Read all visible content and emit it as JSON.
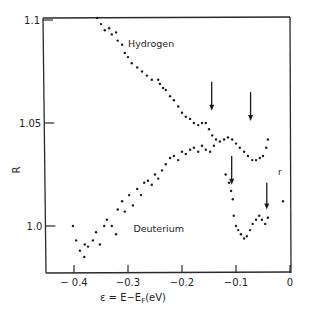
{
  "chart_data": {
    "type": "scatter",
    "title": "",
    "xlabel": "ε = E−E_F(eV)",
    "ylabel": "R",
    "xlim": [
      -0.43,
      0.0
    ],
    "ylim": [
      0.975,
      1.1
    ],
    "x_ticks": [
      -0.4,
      -0.3,
      -0.2,
      -0.1,
      0
    ],
    "x_tick_labels": [
      "− 0.4",
      "−0.3",
      "−0.2",
      "−0.1",
      "0"
    ],
    "y_ticks": [
      1.0,
      1.05,
      1.1
    ],
    "y_tick_labels": [
      "1.0",
      "1.05",
      "1.1"
    ],
    "grid": false,
    "legend": "inline labels",
    "annotations": [
      {
        "type": "arrow-down",
        "x": -0.145,
        "y_top": 1.07,
        "y_bottom": 1.056
      },
      {
        "type": "arrow-down",
        "x": -0.073,
        "y_top": 1.065,
        "y_bottom": 1.051
      },
      {
        "type": "arrow-down",
        "x": -0.108,
        "y_top": 1.034,
        "y_bottom": 1.02
      },
      {
        "type": "arrow-down",
        "x": -0.043,
        "y_top": 1.021,
        "y_bottom": 1.008
      },
      {
        "type": "text",
        "text": "r",
        "x": -0.022,
        "y": 1.025
      }
    ],
    "series": [
      {
        "name": "Hydrogen",
        "label_pos": [
          -0.3,
          1.087
        ],
        "points": [
          [
            -0.357,
            1.101
          ],
          [
            -0.35,
            1.098
          ],
          [
            -0.343,
            1.095
          ],
          [
            -0.335,
            1.096
          ],
          [
            -0.33,
            1.093
          ],
          [
            -0.322,
            1.094
          ],
          [
            -0.319,
            1.09
          ],
          [
            -0.311,
            1.088
          ],
          [
            -0.306,
            1.084
          ],
          [
            -0.3,
            1.082
          ],
          [
            -0.293,
            1.079
          ],
          [
            -0.283,
            1.077
          ],
          [
            -0.274,
            1.075
          ],
          [
            -0.265,
            1.073
          ],
          [
            -0.256,
            1.071
          ],
          [
            -0.244,
            1.071
          ],
          [
            -0.241,
            1.069
          ],
          [
            -0.235,
            1.067
          ],
          [
            -0.23,
            1.066
          ],
          [
            -0.222,
            1.063
          ],
          [
            -0.215,
            1.061
          ],
          [
            -0.207,
            1.058
          ],
          [
            -0.2,
            1.055
          ],
          [
            -0.193,
            1.053
          ],
          [
            -0.185,
            1.052
          ],
          [
            -0.178,
            1.05
          ],
          [
            -0.17,
            1.049
          ],
          [
            -0.163,
            1.05
          ],
          [
            -0.156,
            1.05
          ],
          [
            -0.15,
            1.047
          ],
          [
            -0.144,
            1.044
          ],
          [
            -0.137,
            1.042
          ],
          [
            -0.13,
            1.041
          ],
          [
            -0.122,
            1.042
          ],
          [
            -0.115,
            1.043
          ],
          [
            -0.107,
            1.042
          ],
          [
            -0.1,
            1.04
          ],
          [
            -0.093,
            1.038
          ],
          [
            -0.085,
            1.036
          ],
          [
            -0.078,
            1.034
          ],
          [
            -0.07,
            1.032
          ],
          [
            -0.063,
            1.032
          ],
          [
            -0.056,
            1.033
          ],
          [
            -0.05,
            1.034
          ],
          [
            -0.044,
            1.038
          ],
          [
            -0.041,
            1.042
          ]
        ]
      },
      {
        "name": "Deuterium",
        "label_pos": [
          -0.29,
          0.997
        ],
        "points": [
          [
            -0.402,
            1.0
          ],
          [
            -0.396,
            0.993
          ],
          [
            -0.389,
            0.988
          ],
          [
            -0.381,
            0.985
          ],
          [
            -0.38,
            0.991
          ],
          [
            -0.374,
            0.99
          ],
          [
            -0.365,
            0.993
          ],
          [
            -0.359,
            0.997
          ],
          [
            -0.352,
            0.991
          ],
          [
            -0.344,
            1.0
          ],
          [
            -0.339,
            1.003
          ],
          [
            -0.33,
            1.0
          ],
          [
            -0.322,
            0.996
          ],
          [
            -0.319,
            1.008
          ],
          [
            -0.311,
            1.012
          ],
          [
            -0.306,
            1.007
          ],
          [
            -0.298,
            1.015
          ],
          [
            -0.291,
            1.01
          ],
          [
            -0.283,
            1.018
          ],
          [
            -0.276,
            1.015
          ],
          [
            -0.27,
            1.021
          ],
          [
            -0.263,
            1.022
          ],
          [
            -0.256,
            1.02
          ],
          [
            -0.25,
            1.025
          ],
          [
            -0.244,
            1.023
          ],
          [
            -0.237,
            1.027
          ],
          [
            -0.23,
            1.03
          ],
          [
            -0.222,
            1.033
          ],
          [
            -0.215,
            1.034
          ],
          [
            -0.207,
            1.032
          ],
          [
            -0.2,
            1.036
          ],
          [
            -0.193,
            1.035
          ],
          [
            -0.185,
            1.037
          ],
          [
            -0.178,
            1.038
          ],
          [
            -0.17,
            1.036
          ],
          [
            -0.163,
            1.039
          ],
          [
            -0.156,
            1.037
          ],
          [
            -0.148,
            1.036
          ],
          [
            -0.141,
            1.039
          ],
          [
            -0.119,
            1.025
          ],
          [
            -0.113,
            1.021
          ],
          [
            -0.109,
            1.017
          ],
          [
            -0.106,
            1.013
          ],
          [
            -0.104,
            1.005
          ],
          [
            -0.1,
            1.0
          ],
          [
            -0.096,
            0.998
          ],
          [
            -0.091,
            0.996
          ],
          [
            -0.085,
            0.994
          ],
          [
            -0.08,
            0.995
          ],
          [
            -0.074,
            0.998
          ],
          [
            -0.069,
            1.001
          ],
          [
            -0.063,
            1.003
          ],
          [
            -0.057,
            1.005
          ],
          [
            -0.052,
            1.003
          ],
          [
            -0.046,
            1.001
          ],
          [
            -0.041,
            1.004
          ],
          [
            -0.013,
            1.012
          ]
        ]
      }
    ]
  },
  "axes": {
    "ylabel": "R",
    "xlabel": "ε = E−E",
    "xlabel_sub": "F",
    "xlabel_unit": "(eV)"
  }
}
